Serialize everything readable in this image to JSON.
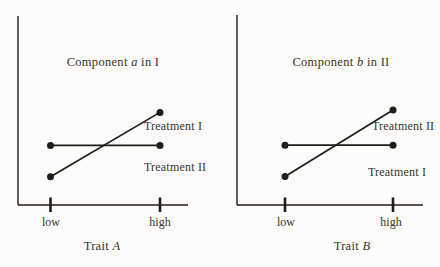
{
  "figure": {
    "background": "#fdfcfa",
    "ink_color": "#1f1d1a",
    "text_color": "#36332c"
  },
  "chart_data": [
    {
      "type": "line",
      "title": "Component a in I",
      "title_parts": {
        "prefix": "Component ",
        "emph": "a",
        "suffix": " in I"
      },
      "xlabel": "Trait A",
      "xlabel_parts": {
        "prefix": "Trait ",
        "emph": "A"
      },
      "x_categories": [
        "low",
        "high"
      ],
      "y_axis": {
        "numeric_labels": false,
        "range": [
          0,
          1
        ]
      },
      "grid": false,
      "legend_position": "inline-right-of-lines",
      "series": [
        {
          "name": "Treatment I",
          "shape": "rising",
          "values": [
            0.15,
            0.49
          ],
          "marker": "dot"
        },
        {
          "name": "Treatment II",
          "shape": "flat",
          "values": [
            0.315,
            0.315
          ],
          "marker": "dot"
        }
      ]
    },
    {
      "type": "line",
      "title": "Component b in II",
      "title_parts": {
        "prefix": "Component ",
        "emph": "b",
        "suffix": " in II"
      },
      "xlabel": "Trait B",
      "xlabel_parts": {
        "prefix": "Trait ",
        "emph": "B"
      },
      "x_categories": [
        "low",
        "high"
      ],
      "y_axis": {
        "numeric_labels": false,
        "range": [
          0,
          1
        ]
      },
      "grid": false,
      "legend_position": "inline-right-of-lines",
      "series": [
        {
          "name": "Treatment II",
          "shape": "rising",
          "values": [
            0.15,
            0.5
          ],
          "marker": "dot"
        },
        {
          "name": "Treatment I",
          "shape": "flat",
          "values": [
            0.315,
            0.315
          ],
          "marker": "dot"
        }
      ]
    }
  ]
}
